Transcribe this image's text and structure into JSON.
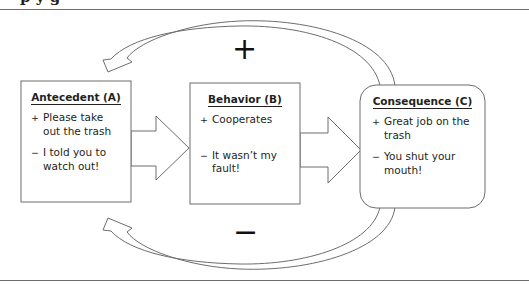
{
  "header": {
    "title_partial": "p y g"
  },
  "diagram": {
    "loop_signs": {
      "top": "+",
      "bottom": "−"
    },
    "boxes": [
      {
        "id": "antecedent",
        "title": "Antecedent (A)",
        "items": [
          {
            "sign": "+",
            "text": "Please take out the trash"
          },
          {
            "sign": "−",
            "text": "I told you to watch out!"
          }
        ]
      },
      {
        "id": "behavior",
        "title": "Behavior (B)",
        "items": [
          {
            "sign": "+",
            "text": "Cooperates"
          },
          {
            "sign": "−",
            "text": "It wasn’t my fault!"
          }
        ]
      },
      {
        "id": "consequence",
        "title": "Consequence (C)",
        "items": [
          {
            "sign": "+",
            "text": "Great job on the trash"
          },
          {
            "sign": "−",
            "text": "You shut your mouth!"
          }
        ]
      }
    ]
  },
  "colors": {
    "stroke": "#6d6d6d",
    "text": "#231f20",
    "background": "#ffffff"
  }
}
